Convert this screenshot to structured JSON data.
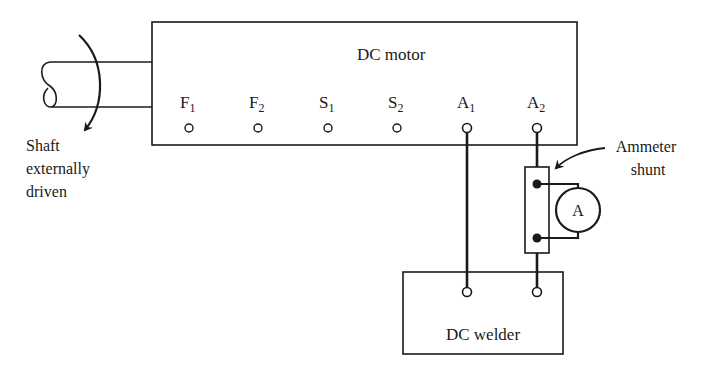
{
  "diagram": {
    "motor": {
      "label": "DC motor",
      "terminals": [
        {
          "name": "F",
          "sub": "1"
        },
        {
          "name": "F",
          "sub": "2"
        },
        {
          "name": "S",
          "sub": "1"
        },
        {
          "name": "S",
          "sub": "2"
        },
        {
          "name": "A",
          "sub": "1"
        },
        {
          "name": "A",
          "sub": "2"
        }
      ]
    },
    "shaft": {
      "label_lines": [
        "Shaft",
        "externally",
        "driven"
      ]
    },
    "shunt": {
      "label_lines": [
        "Ammeter",
        "shunt"
      ]
    },
    "ammeter": {
      "symbol": "A"
    },
    "welder": {
      "label": "DC welder"
    },
    "colors": {
      "ink": "#1a1a1a",
      "background": "#ffffff"
    }
  }
}
